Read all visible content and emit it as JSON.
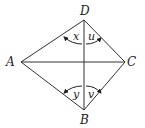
{
  "diagram": {
    "type": "quadrilateral with diagonals",
    "vertices": {
      "A": {
        "label": "A",
        "x": 21,
        "y": 62
      },
      "B": {
        "label": "B",
        "x": 84,
        "y": 110
      },
      "C": {
        "label": "C",
        "x": 125,
        "y": 62
      },
      "D": {
        "label": "D",
        "x": 84,
        "y": 20
      }
    },
    "angles": {
      "x": {
        "label": "x",
        "at": "D",
        "between": [
          "DA",
          "DB"
        ]
      },
      "u": {
        "label": "u",
        "at": "D",
        "between": [
          "DB",
          "DC"
        ]
      },
      "y": {
        "label": "y",
        "at": "B",
        "between": [
          "BA",
          "BD"
        ]
      },
      "v": {
        "label": "v",
        "at": "B",
        "between": [
          "BD",
          "BC"
        ]
      }
    },
    "edges": [
      "AD",
      "DC",
      "CB",
      "BA",
      "AC",
      "DB"
    ],
    "line_color": "#333333"
  }
}
